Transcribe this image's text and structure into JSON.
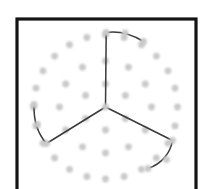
{
  "figure": {
    "canvas": {
      "width": 205,
      "height": 189
    },
    "background_color": "#ffffff",
    "frame": {
      "name": "outer-frame",
      "x": 17,
      "y": 19,
      "width": 179,
      "height": 178,
      "stroke_color": "#141414",
      "stroke_width": 3.2,
      "fill": "none"
    },
    "center": {
      "x": 105.5,
      "y": 107.0
    },
    "dot_style": {
      "color": "#c9c9c9",
      "radius": 3.4,
      "blur": 0.9
    },
    "dot_rings": [
      {
        "name": "inner-ring",
        "radius": 23,
        "count": 6,
        "start_angle_deg": -90,
        "dots": [
          {
            "x": 105.5,
            "y": 84.0
          },
          {
            "x": 125.4,
            "y": 95.5
          },
          {
            "x": 125.4,
            "y": 118.5
          },
          {
            "x": 105.5,
            "y": 130.0
          },
          {
            "x": 85.6,
            "y": 118.5
          },
          {
            "x": 85.6,
            "y": 95.5
          }
        ]
      },
      {
        "name": "middle-ring",
        "radius": 46,
        "count": 12,
        "start_angle_deg": -90,
        "dots": [
          {
            "x": 105.5,
            "y": 61.0
          },
          {
            "x": 128.5,
            "y": 67.2
          },
          {
            "x": 145.3,
            "y": 84.0
          },
          {
            "x": 151.5,
            "y": 107.0
          },
          {
            "x": 145.3,
            "y": 130.0
          },
          {
            "x": 128.5,
            "y": 146.8
          },
          {
            "x": 105.5,
            "y": 153.0
          },
          {
            "x": 82.5,
            "y": 146.8
          },
          {
            "x": 65.7,
            "y": 130.0
          },
          {
            "x": 59.5,
            "y": 107.0
          },
          {
            "x": 65.7,
            "y": 84.0
          },
          {
            "x": 82.5,
            "y": 67.2
          }
        ]
      },
      {
        "name": "outer-ring",
        "radius": 72,
        "count": 24,
        "start_angle_deg": -90,
        "dots": [
          {
            "x": 105.5,
            "y": 35.0
          },
          {
            "x": 124.1,
            "y": 37.5
          },
          {
            "x": 141.5,
            "y": 44.7
          },
          {
            "x": 156.4,
            "y": 56.1
          },
          {
            "x": 168.0,
            "y": 70.8
          },
          {
            "x": 175.0,
            "y": 88.1
          },
          {
            "x": 177.5,
            "y": 107.0
          },
          {
            "x": 175.0,
            "y": 125.9
          },
          {
            "x": 168.0,
            "y": 143.2
          },
          {
            "x": 156.4,
            "y": 157.9
          },
          {
            "x": 141.5,
            "y": 169.3
          },
          {
            "x": 124.1,
            "y": 176.5
          },
          {
            "x": 105.5,
            "y": 179.0
          },
          {
            "x": 86.9,
            "y": 176.5
          },
          {
            "x": 69.5,
            "y": 169.3
          },
          {
            "x": 54.6,
            "y": 157.9
          },
          {
            "x": 43.0,
            "y": 143.2
          },
          {
            "x": 36.0,
            "y": 125.9
          },
          {
            "x": 33.5,
            "y": 107.0
          },
          {
            "x": 36.0,
            "y": 88.1
          },
          {
            "x": 43.0,
            "y": 70.8
          },
          {
            "x": 54.6,
            "y": 56.1
          },
          {
            "x": 69.5,
            "y": 44.7
          },
          {
            "x": 86.9,
            "y": 37.5
          }
        ]
      }
    ],
    "branches": [
      {
        "name": "branch-top",
        "stroke_color": "#3a3a3a",
        "stroke_width": 1.5,
        "path": "M 105.5 107 L 106.2 32.5 C 118.5 30.8 132.0 34.5 143.5 41.5",
        "node_hub": {
          "x": 106.2,
          "y": 32.5
        },
        "node_tip": {
          "x": 143.5,
          "y": 41.5
        }
      },
      {
        "name": "branch-lower-left",
        "stroke_color": "#3a3a3a",
        "stroke_width": 1.5,
        "path": "M 105.5 107 L 46.5 143.5 C 38.0 134.0 33.5 119.5 34.0 104.5",
        "node_hub": {
          "x": 46.5,
          "y": 143.5
        },
        "node_tip": {
          "x": 34.0,
          "y": 104.5
        }
      },
      {
        "name": "branch-lower-right",
        "stroke_color": "#3a3a3a",
        "stroke_width": 1.5,
        "path": "M 105.5 107 L 172.5 140.5 C 170.5 153.0 161.5 164.0 148.0 168.5",
        "node_hub": {
          "x": 172.5,
          "y": 140.5
        },
        "node_tip": {
          "x": 148.0,
          "y": 168.5
        }
      }
    ],
    "branch_nodes": [
      {
        "name": "node-top-hub",
        "x": 106.2,
        "y": 32.5
      },
      {
        "name": "node-top-mid",
        "x": 125.0,
        "y": 32.8
      },
      {
        "name": "node-top-tip",
        "x": 143.5,
        "y": 41.5
      },
      {
        "name": "node-left-hub",
        "x": 46.5,
        "y": 143.5
      },
      {
        "name": "node-left-mid",
        "x": 37.5,
        "y": 124.5
      },
      {
        "name": "node-left-tip",
        "x": 34.0,
        "y": 104.5
      },
      {
        "name": "node-right-hub",
        "x": 172.5,
        "y": 140.5
      },
      {
        "name": "node-right-mid",
        "x": 166.5,
        "y": 159.5
      },
      {
        "name": "node-right-tip",
        "x": 148.0,
        "y": 168.5
      },
      {
        "name": "node-center-hub",
        "x": 105.5,
        "y": 107.0
      }
    ]
  }
}
